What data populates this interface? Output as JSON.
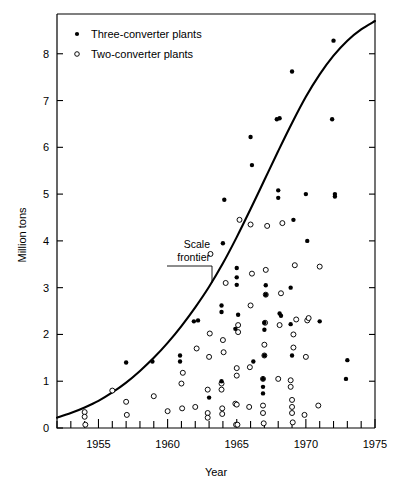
{
  "chart_data": {
    "type": "scatter",
    "title": "",
    "xlabel": "Year",
    "ylabel": "Million tons",
    "xlim": [
      1952,
      1975
    ],
    "ylim": [
      0,
      8.85
    ],
    "x_ticks_major": [
      1955,
      1960,
      1965,
      1970,
      1975
    ],
    "x_ticks_minor_step": 1,
    "y_ticks": [
      0,
      1,
      2,
      3,
      4,
      5,
      6,
      7,
      8
    ],
    "grid": false,
    "legend_position": "top-left",
    "legend": [
      {
        "key": "three",
        "label": "Three-converter plants",
        "marker": "filled-circle"
      },
      {
        "key": "two",
        "label": "Two-converter plants",
        "marker": "open-circle"
      }
    ],
    "annotations": [
      {
        "text_line1": "Scale",
        "text_line2": "frontier",
        "x": 1961.2,
        "y": 3.95,
        "target_x": 1963.1,
        "target_y": 2.95
      }
    ],
    "frontier_curve": {
      "name": "Scale frontier",
      "points": [
        [
          1952.0,
          0.22
        ],
        [
          1953.0,
          0.32
        ],
        [
          1954.0,
          0.44
        ],
        [
          1955.0,
          0.58
        ],
        [
          1956.0,
          0.76
        ],
        [
          1957.0,
          0.97
        ],
        [
          1958.0,
          1.22
        ],
        [
          1959.0,
          1.5
        ],
        [
          1960.0,
          1.82
        ],
        [
          1961.0,
          2.18
        ],
        [
          1962.0,
          2.58
        ],
        [
          1963.0,
          3.02
        ],
        [
          1964.0,
          3.52
        ],
        [
          1965.0,
          4.08
        ],
        [
          1966.0,
          4.68
        ],
        [
          1967.0,
          5.3
        ],
        [
          1968.0,
          5.92
        ],
        [
          1969.0,
          6.52
        ],
        [
          1970.0,
          7.08
        ],
        [
          1971.0,
          7.56
        ],
        [
          1972.0,
          7.96
        ],
        [
          1973.0,
          8.28
        ],
        [
          1974.0,
          8.52
        ],
        [
          1975.0,
          8.7
        ]
      ]
    },
    "series": [
      {
        "name": "Three-converter plants",
        "marker": "filled-circle",
        "points": [
          [
            1957.0,
            1.4
          ],
          [
            1958.9,
            1.42
          ],
          [
            1960.9,
            1.55
          ],
          [
            1960.9,
            1.42
          ],
          [
            1961.9,
            2.28
          ],
          [
            1962.2,
            2.3
          ],
          [
            1963.0,
            0.65
          ],
          [
            1963.9,
            1.0
          ],
          [
            1963.9,
            2.62
          ],
          [
            1963.9,
            2.48
          ],
          [
            1964.0,
            3.95
          ],
          [
            1964.9,
            2.12
          ],
          [
            1964.1,
            4.88
          ],
          [
            1965.0,
            3.42
          ],
          [
            1965.0,
            3.22
          ],
          [
            1965.0,
            3.06
          ],
          [
            1965.1,
            2.42
          ],
          [
            1966.0,
            6.22
          ],
          [
            1966.1,
            5.62
          ],
          [
            1966.2,
            1.42
          ],
          [
            1966.9,
            1.05
          ],
          [
            1966.9,
            0.88
          ],
          [
            1966.9,
            0.74
          ],
          [
            1967.0,
            1.55
          ],
          [
            1967.0,
            2.1
          ],
          [
            1967.0,
            2.25
          ],
          [
            1967.1,
            2.85
          ],
          [
            1967.1,
            3.05
          ],
          [
            1967.9,
            6.6
          ],
          [
            1968.1,
            6.62
          ],
          [
            1968.0,
            4.92
          ],
          [
            1968.0,
            5.08
          ],
          [
            1968.1,
            2.45
          ],
          [
            1968.2,
            2.4
          ],
          [
            1968.9,
            3.0
          ],
          [
            1968.9,
            2.22
          ],
          [
            1969.0,
            1.55
          ],
          [
            1969.1,
            4.45
          ],
          [
            1969.0,
            7.62
          ],
          [
            1970.0,
            5.0
          ],
          [
            1970.1,
            4.0
          ],
          [
            1971.9,
            6.6
          ],
          [
            1972.0,
            8.28
          ],
          [
            1972.1,
            5.0
          ],
          [
            1972.1,
            4.95
          ],
          [
            1973.0,
            1.45
          ],
          [
            1972.9,
            1.05
          ],
          [
            1971.0,
            2.28
          ]
        ]
      },
      {
        "name": "Two-converter plants",
        "marker": "open-circle",
        "points": [
          [
            1954.0,
            0.34
          ],
          [
            1954.0,
            0.24
          ],
          [
            1954.05,
            0.07
          ],
          [
            1956.0,
            0.8
          ],
          [
            1957.0,
            0.56
          ],
          [
            1957.05,
            0.28
          ],
          [
            1959.0,
            0.68
          ],
          [
            1960.0,
            0.36
          ],
          [
            1961.0,
            0.95
          ],
          [
            1961.05,
            0.42
          ],
          [
            1961.1,
            1.18
          ],
          [
            1962.0,
            0.45
          ],
          [
            1962.9,
            0.82
          ],
          [
            1962.9,
            0.32
          ],
          [
            1962.9,
            0.22
          ],
          [
            1963.0,
            1.52
          ],
          [
            1963.05,
            2.02
          ],
          [
            1963.9,
            0.95
          ],
          [
            1963.9,
            0.82
          ],
          [
            1963.95,
            0.42
          ],
          [
            1963.95,
            0.3
          ],
          [
            1964.0,
            1.88
          ],
          [
            1964.05,
            1.62
          ],
          [
            1964.9,
            0.52
          ],
          [
            1965.0,
            0.5
          ],
          [
            1964.95,
            0.07
          ],
          [
            1965.05,
            0.07
          ],
          [
            1965.0,
            1.28
          ],
          [
            1965.0,
            1.12
          ],
          [
            1965.1,
            2.2
          ],
          [
            1965.1,
            2.05
          ],
          [
            1965.9,
            0.45
          ],
          [
            1965.95,
            1.3
          ],
          [
            1966.0,
            2.62
          ],
          [
            1966.9,
            1.05
          ],
          [
            1966.9,
            0.48
          ],
          [
            1966.9,
            0.32
          ],
          [
            1966.95,
            0.1
          ],
          [
            1967.0,
            1.55
          ],
          [
            1967.0,
            1.78
          ],
          [
            1967.05,
            2.25
          ],
          [
            1967.1,
            2.85
          ],
          [
            1967.1,
            3.38
          ],
          [
            1968.0,
            1.05
          ],
          [
            1968.1,
            2.2
          ],
          [
            1968.2,
            2.88
          ],
          [
            1968.9,
            1.02
          ],
          [
            1968.9,
            0.88
          ],
          [
            1969.0,
            0.6
          ],
          [
            1969.0,
            0.45
          ],
          [
            1969.0,
            0.32
          ],
          [
            1969.05,
            0.12
          ],
          [
            1969.1,
            1.72
          ],
          [
            1969.1,
            2.0
          ],
          [
            1969.2,
            3.48
          ],
          [
            1969.9,
            0.28
          ],
          [
            1970.0,
            1.52
          ],
          [
            1970.1,
            2.3
          ],
          [
            1970.9,
            0.48
          ],
          [
            1971.0,
            3.45
          ],
          [
            1966.1,
            3.3
          ],
          [
            1964.2,
            3.1
          ],
          [
            1962.1,
            1.7
          ],
          [
            1967.2,
            4.32
          ],
          [
            1968.3,
            4.38
          ],
          [
            1965.2,
            4.45
          ],
          [
            1963.1,
            3.72
          ],
          [
            1966.0,
            4.35
          ],
          [
            1969.3,
            2.32
          ],
          [
            1970.2,
            2.35
          ]
        ]
      }
    ]
  }
}
